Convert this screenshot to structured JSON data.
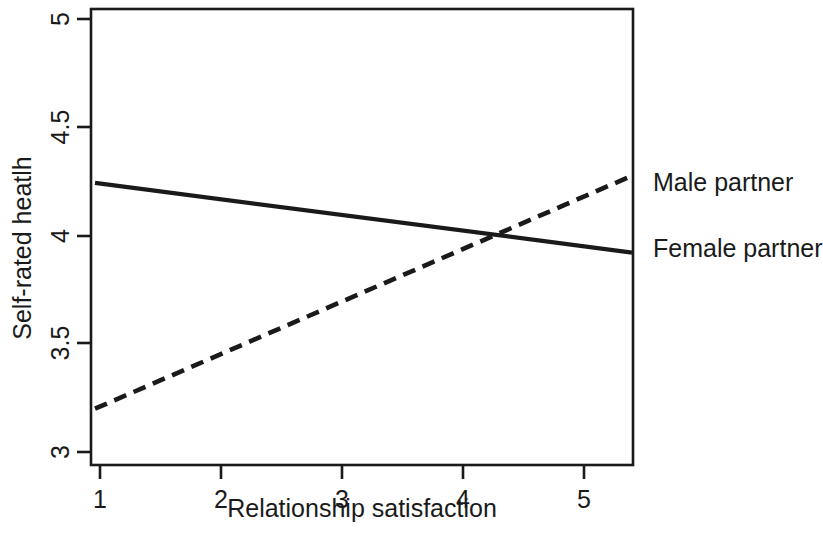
{
  "chart_data": {
    "type": "line",
    "title": "",
    "xlabel": "Relationship satisfaction",
    "ylabel": "Self-rated heatlh",
    "xlim": [
      1,
      5
    ],
    "ylim": [
      3,
      5
    ],
    "xticks": [
      "1",
      "2",
      "3",
      "4",
      "5"
    ],
    "yticks": [
      "3",
      "3.5",
      "4",
      "4.5",
      "5"
    ],
    "grid": false,
    "legend_position": "right-inline-labels",
    "series": [
      {
        "name": "Male partner",
        "style": "solid",
        "color": "#1a1a1a",
        "x": [
          1,
          5
        ],
        "values": [
          4.24,
          3.95
        ],
        "points": [
          [
            1,
            4.24
          ],
          [
            2,
            4.17
          ],
          [
            3,
            4.095
          ],
          [
            4,
            4.02
          ],
          [
            5,
            3.95
          ]
        ]
      },
      {
        "name": "Female partner",
        "style": "dashed",
        "color": "#1a1a1a",
        "x": [
          1,
          5
        ],
        "values": [
          3.21,
          4.18
        ],
        "points": [
          [
            1,
            3.21
          ],
          [
            2,
            3.4525
          ],
          [
            3,
            3.695
          ],
          [
            4,
            3.9375
          ],
          [
            5,
            4.18
          ]
        ]
      }
    ],
    "annotations": [
      {
        "text": "lines cross",
        "x": 4.25,
        "y": 4.0
      }
    ]
  },
  "axes": {
    "x_title": "Relationship satisfaction",
    "y_title": "Self-rated heatlh",
    "x_tick_labels": [
      "1",
      "2",
      "3",
      "4",
      "5"
    ],
    "y_tick_labels": [
      "3",
      "3.5",
      "4",
      "4.5",
      "5"
    ]
  },
  "legend": {
    "male_label": "Male partner",
    "female_label": "Female partner"
  },
  "colors": {
    "ink": "#1a1a1a",
    "background": "#ffffff"
  }
}
